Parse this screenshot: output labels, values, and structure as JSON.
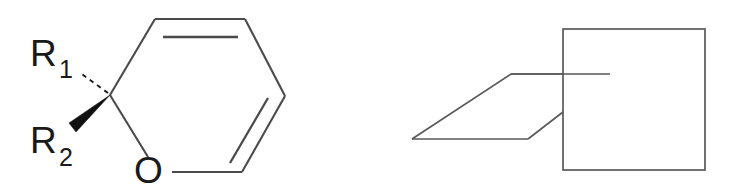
{
  "figure": {
    "title": "",
    "background_color": "#ffffff",
    "line_color": "#4a4a4a",
    "geometry_line_color": "#595959",
    "label_color": "#1a1a1a",
    "wedge_color": "#111111"
  },
  "structure": {
    "name": "2H-pyran-stereocenter",
    "labels": {
      "r1_main": "R",
      "r1_sub": "1",
      "r2_main": "R",
      "r2_sub": "2",
      "oxygen": "O"
    },
    "ring_vertices": [
      {
        "id": "c2",
        "x": 110,
        "y": 95
      },
      {
        "id": "c3",
        "x": 155,
        "y": 19
      },
      {
        "id": "c4",
        "x": 245,
        "y": 19
      },
      {
        "id": "c5",
        "x": 285,
        "y": 96
      },
      {
        "id": "c6",
        "x": 242,
        "y": 172
      },
      {
        "id": "o1",
        "x": 160,
        "y": 172
      }
    ],
    "double_bonds": [
      {
        "from": "c3",
        "to": "c4",
        "inner_offset": "below"
      },
      {
        "from": "c5",
        "to": "c6",
        "inner_offset": "left"
      }
    ],
    "stereo_bonds": [
      {
        "type": "hashed-wedge",
        "substituent": "R1",
        "from_x": 110,
        "from_y": 95,
        "to_x": 78,
        "to_y": 72
      },
      {
        "type": "solid-wedge",
        "substituent": "R2",
        "from_x": 110,
        "from_y": 95,
        "to_x": 73,
        "to_y": 128
      }
    ]
  },
  "geometry_diagram": {
    "name": "plane-intersecting-square",
    "square": {
      "left": 563,
      "top": 29,
      "right": 705,
      "bottom": 170
    },
    "parallelogram": [
      {
        "x": 412,
        "y": 139
      },
      {
        "x": 511,
        "y": 74
      },
      {
        "x": 610,
        "y": 74
      },
      {
        "x": 528,
        "y": 139
      }
    ],
    "hidden_edge_segments": [
      {
        "x1": 511,
        "y1": 74,
        "x2": 563,
        "y2": 74
      },
      {
        "x1": 528,
        "y1": 139,
        "x2": 563,
        "y2": 112
      }
    ]
  }
}
